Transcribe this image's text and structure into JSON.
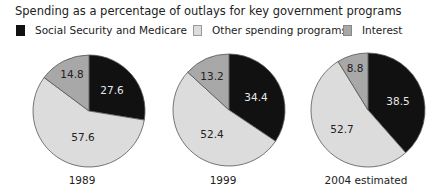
{
  "title": "Spending as a percentage of outlays for key government programs",
  "legend": [
    {
      "label": "Social Security and Medicare",
      "color": "#111111"
    },
    {
      "label": "Other spending programs",
      "color": "#d9d9d9"
    },
    {
      "label": "Interest",
      "color": "#a8a8a8"
    }
  ],
  "pies": [
    {
      "year": "1989",
      "ss": "27.6",
      "other": "57.6",
      "interest": "14.8"
    },
    {
      "year": "1999",
      "ss": "34.4",
      "other": "52.4",
      "interest": "13.2"
    },
    {
      "year": "2004 estimated",
      "ss": "38.5",
      "other": "52.7",
      "interest": "8.8"
    }
  ],
  "chart_data": {
    "type": "pie",
    "title": "Spending as a percentage of outlays for key government programs",
    "categories": [
      "Social Security and Medicare",
      "Other spending programs",
      "Interest"
    ],
    "legend_position": "top",
    "series": [
      {
        "name": "1989",
        "values": [
          27.6,
          57.6,
          14.8
        ]
      },
      {
        "name": "1999",
        "values": [
          34.4,
          52.4,
          13.2
        ]
      },
      {
        "name": "2004 estimated",
        "values": [
          38.5,
          52.7,
          8.8
        ]
      }
    ],
    "colors": [
      "#111111",
      "#d9d9d9",
      "#a8a8a8"
    ]
  }
}
